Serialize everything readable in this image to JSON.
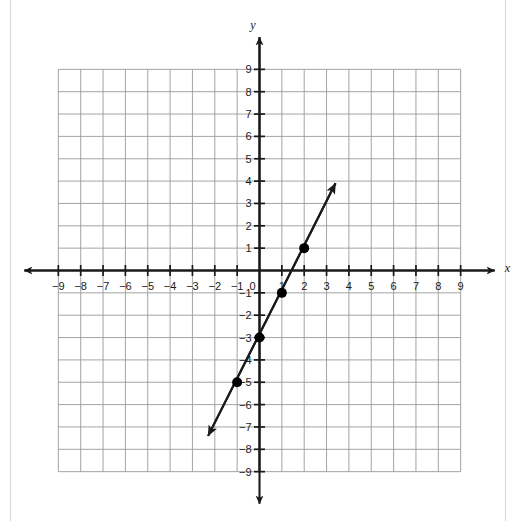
{
  "chart_data": {
    "type": "line",
    "title": "",
    "xlabel": "x",
    "ylabel": "y",
    "xlim": [
      -9,
      9
    ],
    "ylim": [
      -9,
      9
    ],
    "grid": true,
    "legend": "none",
    "equation": "y = 2x - 3",
    "slope": 2,
    "y_intercept": -3,
    "x_ticks": [
      -9,
      -8,
      -7,
      -6,
      -5,
      -4,
      -3,
      -2,
      -1,
      0,
      1,
      2,
      3,
      4,
      5,
      6,
      7,
      8,
      9
    ],
    "y_ticks": [
      -9,
      -8,
      -7,
      -6,
      -5,
      -4,
      -3,
      -2,
      -1,
      1,
      2,
      3,
      4,
      5,
      6,
      7,
      8,
      9
    ],
    "x_tick_labels": [
      "−9",
      "−8",
      "−7",
      "−6",
      "−5",
      "−4",
      "−3",
      "−2",
      "−1",
      "0",
      "1",
      "2",
      "3",
      "4",
      "5",
      "6",
      "7",
      "8",
      "9"
    ],
    "y_tick_labels": [
      "−9",
      "−8",
      "−7",
      "−6",
      "−5",
      "−4",
      "−3",
      "−2",
      "−1",
      "1",
      "2",
      "3",
      "4",
      "5",
      "6",
      "7",
      "8",
      "9"
    ],
    "origin_label": "0",
    "series": [
      {
        "name": "line",
        "marked_points": [
          {
            "x": -1,
            "y": -5
          },
          {
            "x": 0,
            "y": -3
          },
          {
            "x": 1,
            "y": -1
          },
          {
            "x": 2,
            "y": 1
          }
        ],
        "arrow_start": {
          "x": -2.3,
          "y": -7.4
        },
        "arrow_end": {
          "x": 3.4,
          "y": 3.9
        },
        "arrows": "both",
        "color": "#1a1a1a"
      }
    ]
  },
  "axes": {
    "x_axis_name": "x",
    "y_axis_name": "y"
  },
  "colors": {
    "axis": "#1a1a1a",
    "grid": "#9a9a9a",
    "line": "#1a1a1a",
    "point": "#000000",
    "background": "#ffffff",
    "page_border": "#d8d8d8"
  }
}
